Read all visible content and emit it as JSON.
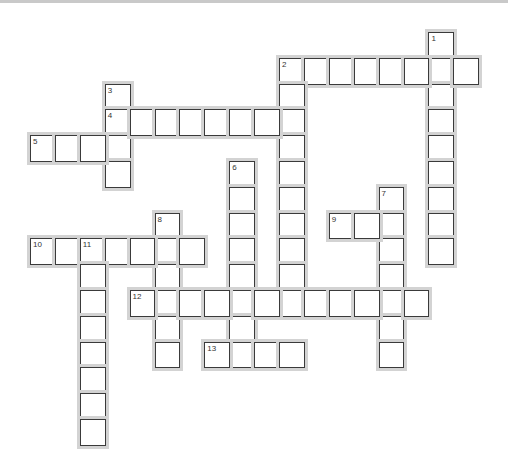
{
  "puzzle": {
    "layout": {
      "origin_x": 30,
      "origin_y": 32,
      "cell_w": 24.9,
      "cell_h": 25.8,
      "colors": {
        "border": "#3a3a3a",
        "halo": "#d3d3d3",
        "cell": "#ffffff",
        "topbar": "#c9c9c9"
      }
    },
    "words": [
      {
        "number": "1",
        "direction": "down",
        "row": 0,
        "col": 16,
        "length": 9
      },
      {
        "number": "2",
        "direction": "across",
        "row": 1,
        "col": 10,
        "length": 8
      },
      {
        "number": "2",
        "direction": "down",
        "row": 1,
        "col": 10,
        "length": 10
      },
      {
        "number": "3",
        "direction": "down",
        "row": 2,
        "col": 3,
        "length": 4
      },
      {
        "number": "4",
        "direction": "across",
        "row": 3,
        "col": 3,
        "length": 8
      },
      {
        "number": "5",
        "direction": "across",
        "row": 4,
        "col": 0,
        "length": 4
      },
      {
        "number": "6",
        "direction": "down",
        "row": 5,
        "col": 8,
        "length": 8
      },
      {
        "number": "7",
        "direction": "down",
        "row": 6,
        "col": 14,
        "length": 7
      },
      {
        "number": "8",
        "direction": "down",
        "row": 7,
        "col": 5,
        "length": 6
      },
      {
        "number": "9",
        "direction": "across",
        "row": 7,
        "col": 12,
        "length": 3
      },
      {
        "number": "10",
        "direction": "across",
        "row": 8,
        "col": 0,
        "length": 7
      },
      {
        "number": "11",
        "direction": "down",
        "row": 8,
        "col": 2,
        "length": 8
      },
      {
        "number": "12",
        "direction": "across",
        "row": 10,
        "col": 4,
        "length": 12
      },
      {
        "number": "13",
        "direction": "across",
        "row": 12,
        "col": 7,
        "length": 4
      }
    ]
  }
}
